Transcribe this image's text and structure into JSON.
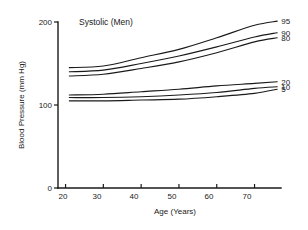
{
  "chart_data": {
    "type": "line",
    "title": "Systolic (Men)",
    "xlabel": "Age (Years)",
    "ylabel": "Blood Pressure (mm Hg)",
    "xlim": [
      18,
      77
    ],
    "ylim": [
      0,
      200
    ],
    "xticks": [
      20,
      30,
      40,
      50,
      60,
      70
    ],
    "yticks": [
      0,
      100,
      200
    ],
    "grid": false,
    "legend_position": "right-inline-labels",
    "x": [
      21,
      30,
      40,
      50,
      60,
      70,
      76
    ],
    "series": [
      {
        "name": "95",
        "label": "95",
        "values": [
          145,
          147,
          157,
          167,
          181,
          196,
          201
        ]
      },
      {
        "name": "90",
        "label": "90",
        "values": [
          140,
          142,
          150,
          159,
          170,
          182,
          187
        ]
      },
      {
        "name": "80",
        "label": "80",
        "values": [
          135,
          137,
          144,
          152,
          163,
          176,
          181
        ]
      },
      {
        "name": "20",
        "label": "20",
        "values": [
          112,
          113,
          116,
          119,
          123,
          126,
          128
        ]
      },
      {
        "name": "10",
        "label": "10",
        "values": [
          109,
          109,
          110,
          112,
          115,
          120,
          122
        ]
      },
      {
        "name": "5",
        "label": "5",
        "values": [
          105,
          105,
          106,
          107,
          110,
          114,
          119
        ]
      }
    ]
  },
  "labels": {
    "title": "Systolic (Men)",
    "x_axis_title": "Age (Years)",
    "y_axis_title": "Blood Pressure (mm Hg)",
    "x_tick_20": "20",
    "x_tick_30": "30",
    "x_tick_40": "40",
    "x_tick_50": "50",
    "x_tick_60": "60",
    "x_tick_70": "70",
    "y_tick_0": "0",
    "y_tick_100": "100",
    "y_tick_200": "200",
    "series_95": "95",
    "series_90": "90",
    "series_80": "80",
    "series_20": "20",
    "series_10": "10",
    "series_5": "5"
  },
  "colors": {
    "ink": "#1a1a1a",
    "background": "#ffffff"
  }
}
